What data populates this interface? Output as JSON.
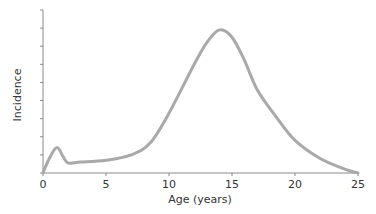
{
  "chart_data": {
    "type": "line",
    "title": "",
    "xlabel": "Age (years)",
    "ylabel": "Incidence",
    "xlim": [
      0,
      25
    ],
    "ylim": [
      0,
      9
    ],
    "x_ticks": [
      0,
      5,
      10,
      15,
      20,
      25
    ],
    "x_tick_labels": [
      "0",
      "5",
      "10",
      "15",
      "20",
      "25"
    ],
    "y_tick_count": 9,
    "y_tick_labels_shown": false,
    "grid": false,
    "legend": null,
    "series": [
      {
        "name": "Incidence",
        "color": "#a9a9a9",
        "x": [
          0,
          0.5,
          1.1,
          1.6,
          2.0,
          3,
          5,
          7,
          8.5,
          10,
          12,
          13,
          14,
          15,
          16,
          17,
          18.5,
          20,
          22,
          24,
          25
        ],
        "values": [
          0,
          0.8,
          1.4,
          0.9,
          0.55,
          0.6,
          0.7,
          1.0,
          1.65,
          3.3,
          6.0,
          7.2,
          7.9,
          7.5,
          6.2,
          4.6,
          3.1,
          1.8,
          0.8,
          0.2,
          0
        ]
      }
    ]
  }
}
